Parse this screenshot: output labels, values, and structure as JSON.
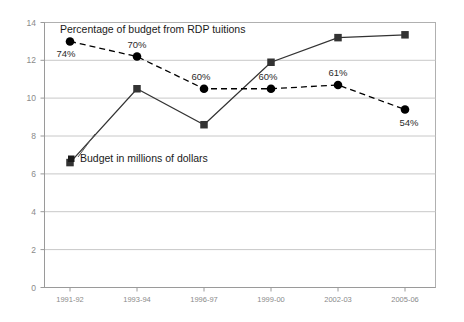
{
  "chart_data": {
    "type": "line",
    "title": "",
    "xlabel": "",
    "ylabel": "",
    "categories": [
      "1991-92",
      "1993-94",
      "1996-97",
      "1999-00",
      "2002-03",
      "2005-06"
    ],
    "ylim": [
      0,
      14
    ],
    "ytick_step": 2,
    "yticks": [
      "0",
      "2",
      "4",
      "6",
      "8",
      "10",
      "12",
      "14"
    ],
    "grid": "horizontal",
    "legend": "inline-annotations",
    "series": [
      {
        "name": "Percentage of budget from RDP tuitions",
        "marker": "circle",
        "line_style": "dashed",
        "color": "#000000",
        "values": [
          13.0,
          12.2,
          10.5,
          10.5,
          10.7,
          9.4
        ],
        "data_labels": [
          "74%",
          "70%",
          "60%",
          "60%",
          "61%",
          "54%"
        ]
      },
      {
        "name": "Budget in millions of dollars",
        "marker": "square",
        "line_style": "solid",
        "color": "#333333",
        "values": [
          6.6,
          10.5,
          8.6,
          11.9,
          13.2,
          13.35
        ],
        "data_labels": [
          "",
          "",
          "",
          "",
          "",
          ""
        ]
      }
    ],
    "annotations": [
      {
        "text": "Percentage of budget from RDP tuitions",
        "role": "series-1-label"
      },
      {
        "text": "Budget in millions of dollars",
        "role": "series-2-label"
      }
    ]
  },
  "colors": {
    "background": "#ffffff",
    "plot_border": "#b0b0b0",
    "gridline": "#c8c8c8",
    "axis_text": "#8a8a8a",
    "series_percentage": "#000000",
    "series_budget": "#333333"
  }
}
